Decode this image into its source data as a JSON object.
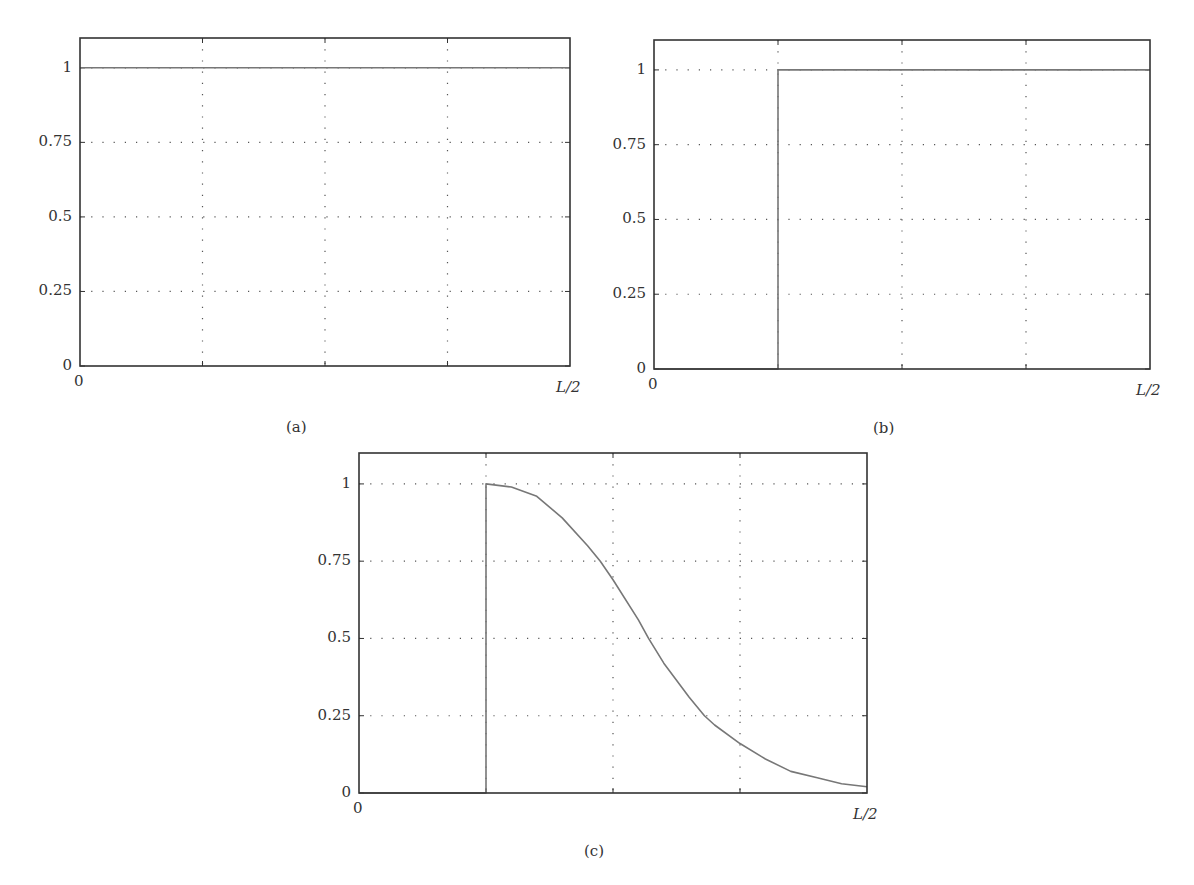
{
  "chart_data": [
    {
      "id": "a",
      "type": "line",
      "caption": "(a)",
      "title": "",
      "xlabel": "",
      "ylabel": "",
      "x_tick_labels": [
        "0",
        "L/2"
      ],
      "y_tick_labels": [
        "0",
        "0.25",
        "0.5",
        "0.75",
        "1"
      ],
      "y_ticks": [
        0,
        0.25,
        0.5,
        0.75,
        1
      ],
      "xlim": [
        0,
        1
      ],
      "xlim_label": [
        "0",
        "L/2"
      ],
      "ylim": [
        0,
        1.1
      ],
      "grid": "dotted, x at quarters of L/2, y at 0.25 steps",
      "legend": null,
      "series": [
        {
          "name": "profile",
          "x": [
            0,
            1
          ],
          "y": [
            1,
            1
          ]
        }
      ]
    },
    {
      "id": "b",
      "type": "line",
      "caption": "(b)",
      "title": "",
      "xlabel": "",
      "ylabel": "",
      "x_tick_labels": [
        "0",
        "L/2"
      ],
      "y_tick_labels": [
        "0",
        "0.25",
        "0.5",
        "0.75",
        "1"
      ],
      "y_ticks": [
        0,
        0.25,
        0.5,
        0.75,
        1
      ],
      "xlim": [
        0,
        1
      ],
      "xlim_label": [
        "0",
        "L/2"
      ],
      "ylim": [
        0,
        1.1
      ],
      "grid": "dotted, x at quarters of L/2, y at 0.25 steps",
      "legend": null,
      "series": [
        {
          "name": "profile",
          "x": [
            0,
            0.25,
            0.25,
            1
          ],
          "y": [
            0,
            0,
            1,
            1
          ]
        }
      ]
    },
    {
      "id": "c",
      "type": "line",
      "caption": "(c)",
      "title": "",
      "xlabel": "",
      "ylabel": "",
      "x_tick_labels": [
        "0",
        "L/2"
      ],
      "y_tick_labels": [
        "0",
        "0.25",
        "0.5",
        "0.75",
        "1"
      ],
      "y_ticks": [
        0,
        0.25,
        0.5,
        0.75,
        1
      ],
      "xlim": [
        0,
        1
      ],
      "xlim_label": [
        "0",
        "L/2"
      ],
      "ylim": [
        0,
        1.1
      ],
      "grid": "dotted, x at quarters of L/2, y at 0.25 steps",
      "legend": null,
      "series": [
        {
          "name": "profile",
          "x": [
            0,
            0.25,
            0.25,
            0.3,
            0.35,
            0.4,
            0.45,
            0.475,
            0.5,
            0.55,
            0.57,
            0.6,
            0.65,
            0.68,
            0.7,
            0.75,
            0.8,
            0.85,
            0.9,
            0.95,
            1.0
          ],
          "y": [
            0,
            0,
            1.0,
            0.99,
            0.96,
            0.89,
            0.8,
            0.75,
            0.69,
            0.56,
            0.5,
            0.42,
            0.31,
            0.25,
            0.22,
            0.16,
            0.11,
            0.07,
            0.05,
            0.03,
            0.02
          ]
        }
      ]
    }
  ],
  "captions": {
    "a": "(a)",
    "b": "(b)",
    "c": "(c)"
  },
  "colors": {
    "axis": "#333333",
    "grid": "#555555",
    "line": "#777777"
  }
}
